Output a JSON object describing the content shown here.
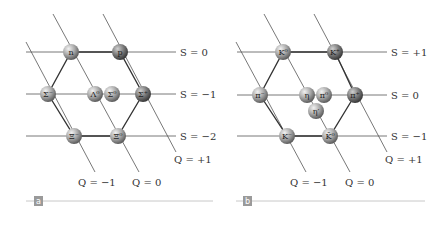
{
  "panels": [
    {
      "tag": "a",
      "strangeness_labels": [
        "S = 0",
        "S = −1",
        "S = −2"
      ],
      "charge_labels": [
        "Q = −1",
        "Q = 0",
        "Q = +1"
      ],
      "particles": [
        {
          "label": "n"
        },
        {
          "label": "p"
        },
        {
          "label": "Σ⁻"
        },
        {
          "label": "Λ⁰"
        },
        {
          "label": "Σ⁰"
        },
        {
          "label": "Σ⁺"
        },
        {
          "label": "Ξ⁻"
        },
        {
          "label": "Ξ⁰"
        }
      ]
    },
    {
      "tag": "b",
      "strangeness_labels": [
        "S = +1",
        "S = 0",
        "S = −1"
      ],
      "charge_labels": [
        "Q = −1",
        "Q = 0",
        "Q = +1"
      ],
      "particles": [
        {
          "label": "K⁰"
        },
        {
          "label": "K⁺"
        },
        {
          "label": "π⁻"
        },
        {
          "label": "η"
        },
        {
          "label": "π⁰"
        },
        {
          "label": "π⁺"
        },
        {
          "label": "η′"
        },
        {
          "label": "K⁻"
        },
        {
          "label": "K̄⁰"
        }
      ]
    }
  ],
  "colors": {
    "line": "#444444",
    "node_light": "#c8c8c8",
    "node_dark": "#6e6e6e",
    "tag_bg": "#9a9a9a",
    "rule": "#c8c8c8"
  }
}
